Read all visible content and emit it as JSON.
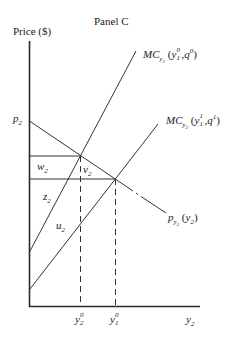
{
  "title": "Panel C",
  "y_axis_label": "Price ($)",
  "x_axis_label": {
    "base": "y",
    "sub": "2"
  },
  "price_label": {
    "base": "p",
    "sub": "2"
  },
  "curves": {
    "mc_initial": {
      "base": "MC",
      "sub": "y2",
      "args_base1": "y",
      "args_sup1": "0",
      "args_sub1": "1",
      "args_base2": "q",
      "args_sup2": "0"
    },
    "mc_new": {
      "base": "MC",
      "sub": "y2",
      "args_base1": "y",
      "args_sup1": "1",
      "args_sub1": "1",
      "args_base2": "q",
      "args_sup2": "1"
    },
    "demand": {
      "base": "p",
      "sub": "y2",
      "arg_base": "y",
      "arg_sub": "2"
    }
  },
  "areas": {
    "w": {
      "base": "w",
      "sub": "2"
    },
    "v": {
      "base": "v",
      "sub": "2"
    },
    "z": {
      "base": "z",
      "sub": "2"
    },
    "u": {
      "base": "u",
      "sub": "2"
    }
  },
  "x_ticks": [
    {
      "base": "y",
      "sup": "0",
      "sub": "2"
    },
    {
      "base": "y",
      "sup": "0",
      "sub": "1"
    }
  ],
  "colors": {
    "line": "#333333",
    "axis": "#2a2a2a"
  }
}
